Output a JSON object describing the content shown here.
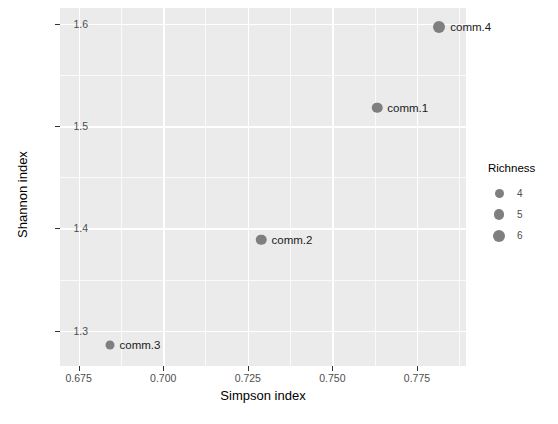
{
  "chart_data": {
    "type": "scatter",
    "title": "",
    "xlabel": "Simpson index",
    "ylabel": "Shannon index",
    "xlim": [
      0.6695,
      0.7895
    ],
    "ylim": [
      1.2655,
      1.6155
    ],
    "grid": true,
    "x_ticks": [
      "0.675",
      "0.700",
      "0.725",
      "0.750",
      "0.775"
    ],
    "x_tick_values": [
      0.675,
      0.7,
      0.725,
      0.75,
      0.775
    ],
    "x_minor_values": [
      0.6875,
      0.7125,
      0.7375,
      0.7625,
      0.7875
    ],
    "y_ticks": [
      "1.3",
      "1.4",
      "1.5",
      "1.6"
    ],
    "y_tick_values": [
      1.3,
      1.4,
      1.5,
      1.6
    ],
    "y_minor_values": [
      1.35,
      1.45,
      1.55
    ],
    "points": [
      {
        "label": "comm.1",
        "x": 0.7632,
        "y": 1.518,
        "richness": 5
      },
      {
        "label": "comm.2",
        "x": 0.729,
        "y": 1.389,
        "richness": 5
      },
      {
        "label": "comm.3",
        "x": 0.6843,
        "y": 1.286,
        "richness": 4
      },
      {
        "label": "comm.4",
        "x": 0.7816,
        "y": 1.597,
        "richness": 6
      }
    ],
    "point_color": "#7f7f7f",
    "panel_color": "#ebebeb",
    "gridline_color": "#ffffff",
    "legend": {
      "title": "Richness",
      "position": "right",
      "entries": [
        {
          "label": "4",
          "value": 4
        },
        {
          "label": "5",
          "value": 5
        },
        {
          "label": "6",
          "value": 6
        }
      ]
    }
  }
}
